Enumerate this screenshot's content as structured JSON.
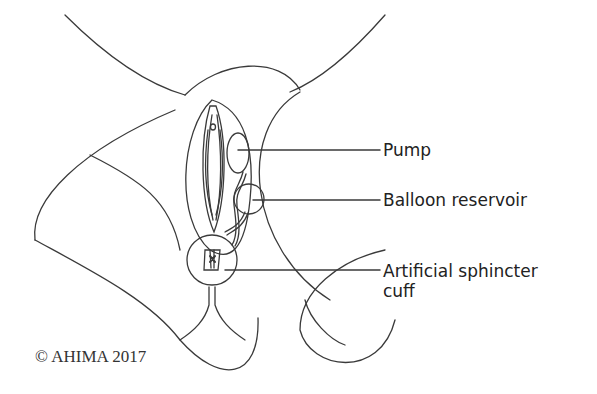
{
  "figure": {
    "labels": {
      "pump": "Pump",
      "reservoir": "Balloon reservoir",
      "cuff_line1": "Artificial sphincter",
      "cuff_line2": "cuff"
    },
    "copyright": "© AHIMA 2017",
    "colors": {
      "line": "#3a3a3a",
      "text": "#222222",
      "background": "#ffffff"
    }
  }
}
